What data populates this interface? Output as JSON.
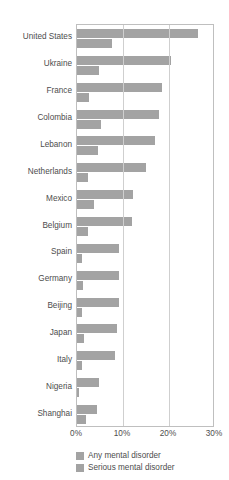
{
  "chart_data": {
    "type": "bar",
    "orientation": "horizontal",
    "title": "",
    "xlabel": "",
    "ylabel": "",
    "xlim": [
      0,
      30
    ],
    "xticks": [
      0,
      10,
      20,
      30
    ],
    "xtick_labels": [
      "0%",
      "10%",
      "20%",
      "30%"
    ],
    "grid": true,
    "grid_axis": "x",
    "legend_position": "bottom-left",
    "categories": [
      "United States",
      "Ukraine",
      "France",
      "Colombia",
      "Lebanon",
      "Netherlands",
      "Mexico",
      "Belgium",
      "Spain",
      "Germany",
      "Beijing",
      "Japan",
      "Italy",
      "Nigeria",
      "Shanghai"
    ],
    "series": [
      {
        "name": "Any mental disorder",
        "color": "#a3a3a3",
        "values": [
          26.4,
          20.5,
          18.4,
          17.8,
          16.9,
          14.9,
          12.2,
          12.0,
          9.2,
          9.1,
          9.1,
          8.8,
          8.2,
          4.7,
          4.3
        ]
      },
      {
        "name": "Serious mental disorder",
        "color": "#a3a3a3",
        "values": [
          7.7,
          4.8,
          2.7,
          5.2,
          4.6,
          2.4,
          3.7,
          2.4,
          1.0,
          1.2,
          1.0,
          1.5,
          1.0,
          0.4,
          1.9
        ]
      }
    ]
  },
  "legend": {
    "items": [
      {
        "label": "Any mental disorder"
      },
      {
        "label": "Serious mental disorder"
      }
    ]
  },
  "colors": {
    "bar": "#a3a3a3",
    "frame": "#bfbfbf",
    "gridline": "#cfcfcf",
    "text": "#4d4d4d"
  }
}
